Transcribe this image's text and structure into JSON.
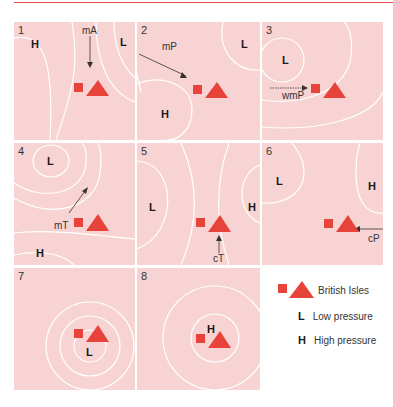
{
  "colors": {
    "panel_bg": "#f7d3d3",
    "isobar": "#ffffff",
    "british_isles": "#e8433a",
    "accent_rule": "#e5484d",
    "text": "#1a1a1a"
  },
  "panels": [
    {
      "number": "1",
      "air_mass": "mA",
      "labels": [
        {
          "text": "H"
        },
        {
          "text": "L"
        }
      ],
      "arrow_direction": "from north"
    },
    {
      "number": "2",
      "air_mass": "mP",
      "labels": [
        {
          "text": "L"
        },
        {
          "text": "H"
        }
      ],
      "arrow_direction": "from north-west"
    },
    {
      "number": "3",
      "air_mass": "wmP",
      "labels": [
        {
          "text": "L"
        }
      ],
      "arrow_direction": "from west"
    },
    {
      "number": "4",
      "air_mass": "mT",
      "labels": [
        {
          "text": "L"
        },
        {
          "text": "H"
        }
      ],
      "arrow_direction": "from south-west"
    },
    {
      "number": "5",
      "air_mass": "cT",
      "labels": [
        {
          "text": "L"
        },
        {
          "text": "H"
        }
      ],
      "arrow_direction": "from south"
    },
    {
      "number": "6",
      "air_mass": "cP",
      "labels": [
        {
          "text": "L"
        },
        {
          "text": "H"
        }
      ],
      "arrow_direction": "from east"
    },
    {
      "number": "7",
      "air_mass": "",
      "labels": [
        {
          "text": "L"
        }
      ],
      "arrow_direction": "none"
    },
    {
      "number": "8",
      "air_mass": "",
      "labels": [
        {
          "text": "H"
        }
      ],
      "arrow_direction": "none"
    }
  ],
  "legend": {
    "british_isles": "British Isles",
    "low_key": "L",
    "low_label": "Low pressure",
    "high_key": "H",
    "high_label": "High pressure"
  }
}
